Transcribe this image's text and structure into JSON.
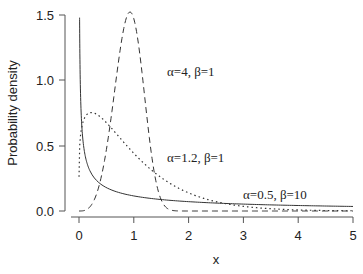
{
  "chart_data": {
    "type": "line",
    "title": "",
    "xlabel": "x",
    "ylabel": "Probability density",
    "xlim": [
      0,
      5
    ],
    "ylim": [
      0,
      1.5
    ],
    "xticks": [
      "0",
      "1",
      "2",
      "3",
      "4",
      "5"
    ],
    "yticks": [
      "0.0",
      "0.5",
      "1.0",
      "1.5"
    ],
    "grid": false,
    "legend": "none (inline annotations)",
    "series": [
      {
        "name": "α=4, β=1",
        "style": "dashed",
        "x": [
          0,
          0.2,
          0.4,
          0.6,
          0.8,
          0.93,
          1.0,
          1.2,
          1.4,
          1.6,
          2.0,
          3.0,
          5.0
        ],
        "values": [
          0,
          0.03,
          0.25,
          0.76,
          1.37,
          1.54,
          1.47,
          0.87,
          0.23,
          0.02,
          0.0,
          0.0,
          0.0
        ]
      },
      {
        "name": "α=1.2, β=1",
        "style": "dotted",
        "x": [
          0.02,
          0.1,
          0.22,
          0.5,
          1.0,
          1.5,
          2.0,
          2.5,
          3.0,
          4.0,
          5.0
        ],
        "values": [
          0.5,
          0.69,
          0.75,
          0.64,
          0.44,
          0.28,
          0.17,
          0.1,
          0.06,
          0.02,
          0.01
        ]
      },
      {
        "name": "α=0.5, β=10",
        "style": "solid",
        "x": [
          0.01,
          0.05,
          0.1,
          0.25,
          0.5,
          1.0,
          2.0,
          3.0,
          4.0,
          5.0
        ],
        "values": [
          1.53,
          0.66,
          0.45,
          0.27,
          0.18,
          0.12,
          0.07,
          0.05,
          0.04,
          0.035
        ]
      }
    ],
    "annotations": [
      {
        "text": "α=4, β=1",
        "x": 2.0,
        "y": 1.05
      },
      {
        "text": "α=1.2, β=1",
        "x": 2.0,
        "y": 0.48
      },
      {
        "text": "α=0.5, β=10",
        "x": 3.0,
        "y": 0.12
      }
    ]
  },
  "labels": {
    "ylabel": "Probability density",
    "xlabel": "x",
    "xticks": [
      "0",
      "1",
      "2",
      "3",
      "4",
      "5"
    ],
    "yticks": [
      "0.0",
      "0.5",
      "1.0",
      "1.5"
    ],
    "annot1": "α=4, β=1",
    "annot2": "α=1.2, β=1",
    "annot3": "α=0.5, β=10"
  }
}
